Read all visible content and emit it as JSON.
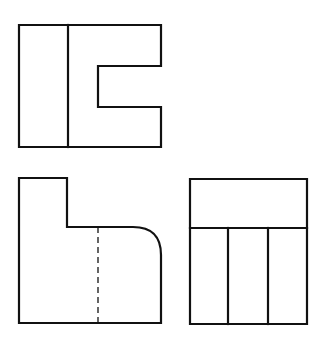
{
  "drawing": {
    "type": "orthographic-projection",
    "views": [
      {
        "name": "top-view",
        "outline": "M19,25 L161,25 L161,66 L98,66 L98,107 L161,107 L161,147 L19,147 Z",
        "visible_lines": [
          "M68,25 L68,147"
        ],
        "hidden_lines": []
      },
      {
        "name": "front-view",
        "outline": "M19,178 L67,178 L67,227 L133,227 Q161,227 161,255 L161,323 L19,323 Z",
        "visible_lines": [],
        "hidden_lines": [
          "M98,227 L98,323"
        ]
      },
      {
        "name": "side-view",
        "outline": "M190,179 L307,179 L307,324 L190,324 Z",
        "visible_lines": [
          "M190,228 L307,228",
          "M228,228 L228,324",
          "M268,228 L268,324"
        ],
        "hidden_lines": []
      }
    ],
    "line_color": "#111111",
    "background": "#ffffff"
  }
}
